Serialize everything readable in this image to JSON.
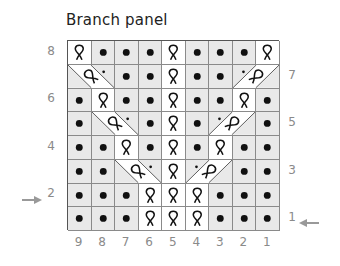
{
  "title": "Branch panel",
  "columns": [
    "9",
    "8",
    "7",
    "6",
    "5",
    "4",
    "3",
    "2",
    "1"
  ],
  "row_labels_left": [
    {
      "row": 8,
      "label": "8"
    },
    {
      "row": 6,
      "label": "6"
    },
    {
      "row": 4,
      "label": "4"
    },
    {
      "row": 2,
      "label": "2"
    }
  ],
  "row_labels_right": [
    {
      "row": 7,
      "label": "7"
    },
    {
      "row": 5,
      "label": "5"
    },
    {
      "row": 3,
      "label": "3"
    },
    {
      "row": 1,
      "label": "1"
    }
  ],
  "arrows": {
    "left_row": "2",
    "right_row": "1"
  },
  "legend_symbols": {
    "p": "purl (dot)",
    "tw": "twisted knit stitch",
    "rc": "right-slanting twisted cross with purl",
    "lc": "left-slanting twisted cross with purl"
  },
  "rows": [
    {
      "row": 8,
      "cells": [
        "tw",
        "p",
        "p",
        "p",
        "tw",
        "p",
        "p",
        "p",
        "tw"
      ]
    },
    {
      "row": 7,
      "cells": [
        "rc",
        "rc",
        "p",
        "p",
        "tw",
        "p",
        "p",
        "lc",
        "lc"
      ]
    },
    {
      "row": 6,
      "cells": [
        "p",
        "tw",
        "p",
        "p",
        "tw",
        "p",
        "p",
        "tw",
        "p"
      ]
    },
    {
      "row": 5,
      "cells": [
        "p",
        "rc",
        "rc",
        "p",
        "tw",
        "p",
        "lc",
        "lc",
        "p"
      ]
    },
    {
      "row": 4,
      "cells": [
        "p",
        "p",
        "tw",
        "p",
        "tw",
        "p",
        "tw",
        "p",
        "p"
      ]
    },
    {
      "row": 3,
      "cells": [
        "p",
        "p",
        "rc",
        "rc",
        "tw",
        "lc",
        "lc",
        "p",
        "p"
      ]
    },
    {
      "row": 2,
      "cells": [
        "p",
        "p",
        "p",
        "tw",
        "tw",
        "tw",
        "p",
        "p",
        "p"
      ]
    },
    {
      "row": 1,
      "cells": [
        "p",
        "p",
        "p",
        "tw",
        "tw",
        "tw",
        "p",
        "p",
        "p"
      ]
    }
  ],
  "colors": {
    "purl_bg": "#e9e9e9",
    "twist_bg": "#ffffff",
    "grid_line": "#8a8a8a",
    "label": "#8a8a8a",
    "ink": "#111111"
  }
}
